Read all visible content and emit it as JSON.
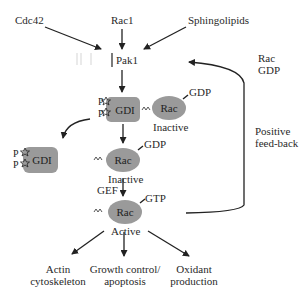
{
  "diagram": {
    "colors": {
      "background": "#ffffff",
      "shape_fill": "#9a9a9a",
      "stroke": "#222222",
      "text": "#2a2a2a",
      "faint_marks": "#dddddd"
    },
    "inputs": {
      "cdc42": "Cdc42",
      "rac1": "Rac1",
      "sphingolipids": "Sphingolipids"
    },
    "pak1": "Pak1",
    "complex": {
      "gdi": "GDI",
      "p_top": "P",
      "p_bottom": "P",
      "rac": "Rac",
      "gdp": "GDP",
      "state": "Inactive"
    },
    "released_gdi": {
      "gdi": "GDI",
      "p_top": "P",
      "p_bottom": "P"
    },
    "free_rac": {
      "rac": "Rac",
      "gdp": "GDP",
      "state": "Inactive"
    },
    "active_rac": {
      "gef": "GEF",
      "rac": "Rac",
      "gtp": "GTP",
      "state": "Active"
    },
    "feedback": {
      "rac_gdp_line1": "Rac",
      "rac_gdp_line2": "GDP",
      "label_line1": "Positive",
      "label_line2": "feed-back"
    },
    "outputs": [
      {
        "line1": "Actin",
        "line2": "cytoskeleton"
      },
      {
        "line1": "Growth control/",
        "line2": "apoptosis"
      },
      {
        "line1": "Oxidant",
        "line2": "production"
      }
    ]
  }
}
